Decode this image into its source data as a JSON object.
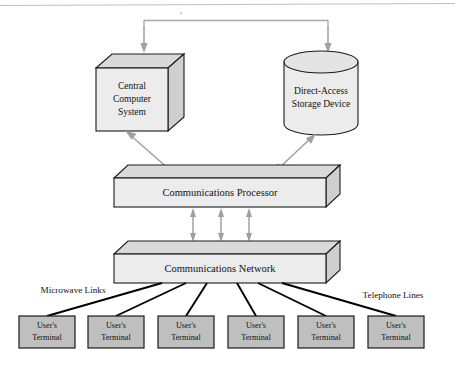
{
  "diagram": {
    "nodes": {
      "central_computer": {
        "label_lines": [
          "Central",
          "Computer",
          "System"
        ],
        "shape": "cube-3d",
        "fill": "#ececed"
      },
      "storage_device": {
        "label_lines": [
          "Direct-Access",
          "Storage Device"
        ],
        "shape": "cylinder",
        "fill": "#ececed"
      },
      "communications_processor": {
        "label": "Communications Processor",
        "shape": "slab-3d",
        "fill": "#ececed"
      },
      "communications_network": {
        "label": "Communications Network",
        "shape": "slab-3d",
        "fill": "#ececed"
      }
    },
    "annotations": {
      "left_link_label": "Microwave Links",
      "right_link_label": "Telephone Lines"
    },
    "terminals": [
      {
        "label_lines": [
          "User's",
          "Terminal"
        ]
      },
      {
        "label_lines": [
          "User's",
          "Terminal"
        ]
      },
      {
        "label_lines": [
          "User's",
          "Terminal"
        ]
      },
      {
        "label_lines": [
          "User's",
          "Terminal"
        ]
      },
      {
        "label_lines": [
          "User's",
          "Terminal"
        ]
      },
      {
        "label_lines": [
          "User's",
          "Terminal"
        ]
      }
    ],
    "colors": {
      "outline": "#1a1a1a",
      "face_front": "#ececed",
      "face_top": "#d9d9da",
      "face_side": "#cfcfd0",
      "terminal_fill": "#bfbfbf",
      "arrow_gray": "#a0a0a0",
      "link_black": "#000000",
      "background": "#ffffff"
    }
  }
}
